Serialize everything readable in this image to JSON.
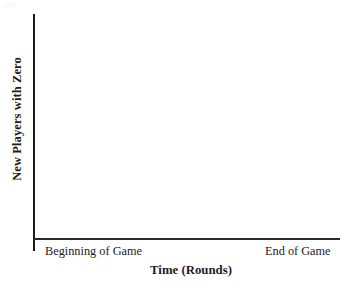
{
  "chart_data": {
    "type": "line",
    "title": "",
    "subtitle": "",
    "xlabel": "Time (Rounds)",
    "ylabel": "New Players with Zero",
    "x_tick_labels": [
      "Beginning of Game",
      "End of Game"
    ],
    "y_tick_labels": [],
    "series": [],
    "values": [],
    "categories": [],
    "grid": false,
    "legend": false,
    "legend_position": "none",
    "annotations": [],
    "axis_style": {
      "spines": [
        "left",
        "bottom"
      ],
      "axis_color": "#1d1d1d",
      "axis_width_px": 2,
      "background": "#ffffff"
    },
    "note": "Blank axes template - no data plotted in the figure area"
  },
  "figure": {
    "ylabel": "New Players with Zero",
    "xlabel": "Time (Rounds)",
    "xtick_left": "Beginning of Game",
    "xtick_right": "End of Game",
    "colors": {
      "axis": "#1d1d1d",
      "text": "#1d1d1d",
      "background": "#ffffff"
    }
  }
}
